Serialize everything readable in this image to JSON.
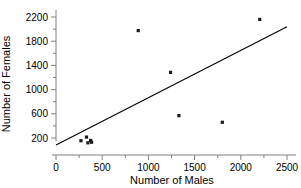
{
  "chart_data": {
    "type": "scatter",
    "title": "",
    "xlabel": "Number of Males",
    "ylabel": "Number of Females",
    "xlim": [
      0,
      2500
    ],
    "ylim": [
      0,
      2300
    ],
    "grid": false,
    "legend": null,
    "x_ticks": [
      0,
      500,
      1000,
      1500,
      2000,
      2500
    ],
    "x_tick_labels": [
      "0",
      "500",
      "1000",
      "1500",
      "2000",
      "2500"
    ],
    "x_minor_ticks": [
      250,
      750,
      1250,
      1750,
      2250
    ],
    "y_ticks": [
      200,
      600,
      1000,
      1400,
      1800,
      2200
    ],
    "y_tick_labels": [
      "200",
      "600",
      "1000",
      "1400",
      "1800",
      "2200"
    ],
    "y_minor_ticks": [
      400,
      800,
      1200,
      1600,
      2000
    ],
    "points": [
      {
        "x": 270,
        "y": 155
      },
      {
        "x": 330,
        "y": 215
      },
      {
        "x": 345,
        "y": 120
      },
      {
        "x": 375,
        "y": 160
      },
      {
        "x": 385,
        "y": 130
      },
      {
        "x": 890,
        "y": 1975
      },
      {
        "x": 1240,
        "y": 1285
      },
      {
        "x": 1330,
        "y": 570
      },
      {
        "x": 1800,
        "y": 460
      },
      {
        "x": 2205,
        "y": 2160
      }
    ],
    "trend_line": {
      "x1": 0,
      "y1": 85,
      "x2": 2500,
      "y2": 2040
    }
  },
  "axis": {
    "x_label": "Number of Males",
    "y_label": "Number of Females"
  }
}
